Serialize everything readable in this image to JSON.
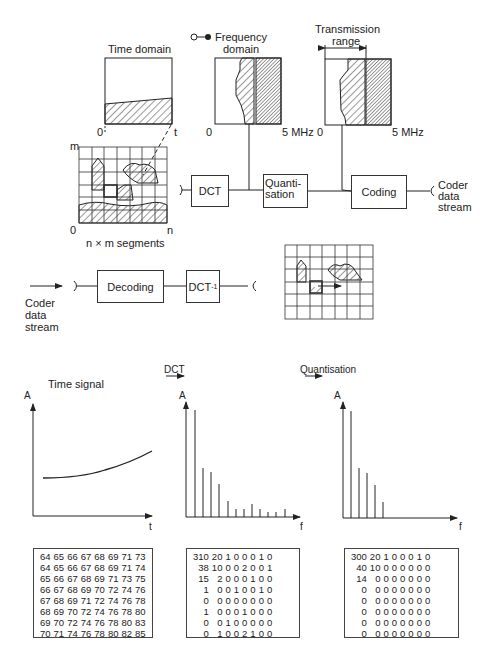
{
  "legend": {
    "label_line1": "Frequency",
    "label_line2": "domain"
  },
  "time_domain": {
    "title": "Time domain",
    "x0": "0",
    "x_end": "t"
  },
  "freq_panel": {
    "x0": "0",
    "x_end": "5 MHz"
  },
  "transmission_panel": {
    "title_line1": "Transmission",
    "title_line2": "range",
    "x0": "0",
    "x_end": "5 MHz"
  },
  "segment_grid": {
    "y_label": "m",
    "x0": "0",
    "x_end": "n",
    "caption": "n × m segments"
  },
  "encoder": {
    "dct": "DCT",
    "quant_line1": "Quanti-",
    "quant_line2": "sation",
    "coding": "Coding",
    "out_line1": "Coder",
    "out_line2": "data",
    "out_line3": "stream"
  },
  "decoder": {
    "decoding": "Decoding",
    "idct": "DCT",
    "idct_sup": "-1",
    "in_line1": "Coder",
    "in_line2": "data",
    "in_line3": "stream"
  },
  "bottom": {
    "dct_arrow": "DCT",
    "quant_arrow": "Quantisation"
  },
  "chart_data": [
    {
      "type": "line",
      "title": "Time signal",
      "xlabel": "t",
      "ylabel": "A",
      "x": [
        0,
        1,
        2,
        3,
        4,
        5,
        6,
        7,
        8,
        9,
        10
      ],
      "values": [
        64,
        64.3,
        65,
        66,
        67,
        68.5,
        70,
        72,
        74,
        77,
        80
      ]
    },
    {
      "type": "bar",
      "title": "DCT",
      "xlabel": "f",
      "ylabel": "A",
      "categories": [
        1,
        2,
        3,
        4,
        5,
        6,
        7,
        8,
        9,
        10,
        11,
        12
      ],
      "values": [
        100,
        46,
        42,
        30,
        14,
        7,
        7,
        10,
        7,
        3,
        3,
        6
      ]
    },
    {
      "type": "bar",
      "title": "Quantisation",
      "xlabel": "f",
      "ylabel": "A",
      "categories": [
        1,
        2,
        3,
        4,
        5
      ],
      "values": [
        100,
        46,
        42,
        30,
        14
      ]
    }
  ],
  "matrices": {
    "time": [
      [
        64,
        65,
        66,
        67,
        68,
        69,
        71,
        73
      ],
      [
        64,
        65,
        66,
        67,
        68,
        69,
        71,
        74
      ],
      [
        65,
        66,
        67,
        68,
        69,
        71,
        73,
        75
      ],
      [
        66,
        67,
        68,
        69,
        70,
        72,
        74,
        76
      ],
      [
        67,
        68,
        69,
        71,
        72,
        74,
        76,
        78
      ],
      [
        68,
        69,
        70,
        72,
        74,
        76,
        78,
        80
      ],
      [
        69,
        70,
        72,
        74,
        76,
        78,
        80,
        83
      ],
      [
        70,
        71,
        74,
        76,
        78,
        80,
        82,
        85
      ]
    ],
    "dct": [
      [
        310,
        20,
        1,
        0,
        0,
        0,
        1,
        0
      ],
      [
        38,
        10,
        0,
        0,
        2,
        0,
        0,
        1
      ],
      [
        15,
        2,
        0,
        0,
        0,
        1,
        0,
        0
      ],
      [
        1,
        0,
        0,
        1,
        0,
        0,
        1,
        0
      ],
      [
        0,
        0,
        0,
        0,
        0,
        0,
        0,
        0
      ],
      [
        1,
        0,
        0,
        0,
        1,
        0,
        0,
        0
      ],
      [
        0,
        0,
        1,
        0,
        0,
        0,
        0,
        0
      ],
      [
        0,
        1,
        0,
        0,
        2,
        1,
        0,
        0
      ]
    ],
    "quant": [
      [
        300,
        20,
        1,
        0,
        0,
        0,
        1,
        0
      ],
      [
        40,
        10,
        0,
        0,
        0,
        0,
        0,
        0
      ],
      [
        14,
        0,
        0,
        0,
        0,
        0,
        0,
        0
      ],
      [
        0,
        0,
        0,
        0,
        0,
        0,
        0,
        0
      ],
      [
        0,
        0,
        0,
        0,
        0,
        0,
        0,
        0
      ],
      [
        0,
        0,
        0,
        0,
        0,
        0,
        0,
        0
      ],
      [
        0,
        0,
        0,
        0,
        0,
        0,
        0,
        0
      ],
      [
        0,
        0,
        0,
        0,
        0,
        0,
        0,
        0
      ]
    ]
  }
}
